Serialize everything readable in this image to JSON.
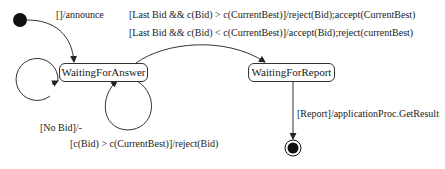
{
  "diagram": {
    "type": "state-machine",
    "states": [
      {
        "id": "initial",
        "kind": "initial"
      },
      {
        "id": "waiting_for_answer",
        "label": "WaitingForAnswer"
      },
      {
        "id": "waiting_for_report",
        "label": "WaitingForReport"
      },
      {
        "id": "final",
        "kind": "final"
      }
    ],
    "transitions": [
      {
        "from": "initial",
        "to": "waiting_for_answer",
        "label": "[]/announce"
      },
      {
        "from": "waiting_for_answer",
        "to": "waiting_for_report",
        "label": "[Last Bid && c(Bid) > c(CurrentBest)]/reject(Bid);accept(CurrentBest)"
      },
      {
        "from": "waiting_for_answer",
        "to": "waiting_for_report",
        "label": "[Last Bid && c(Bid) < c(CurrentBest)]/accept(Bid);reject(currentBest)"
      },
      {
        "from": "waiting_for_answer",
        "to": "waiting_for_answer",
        "label": "[No Bid]/-"
      },
      {
        "from": "waiting_for_answer",
        "to": "waiting_for_answer",
        "label": "[c(Bid) > c(CurrentBest)]/reject(Bid)"
      },
      {
        "from": "waiting_for_report",
        "to": "final",
        "label": "[Report]/applicationProc.GetResult"
      }
    ]
  }
}
